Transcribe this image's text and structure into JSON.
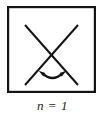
{
  "figure": {
    "caption": "n = 1",
    "caption_variable": "n",
    "caption_relation": "=",
    "caption_value": "1",
    "stroke_color": "#141414",
    "background_color": "#ffffff",
    "box": {
      "x": 7,
      "y": 6,
      "width": 89,
      "height": 87,
      "border_width": 2.2
    },
    "cross": {
      "line_width": 2.0,
      "line_a": {
        "x1": 25,
        "y1": 25,
        "x2": 78,
        "y2": 85
      },
      "line_b": {
        "x1": 78,
        "y1": 25,
        "x2": 25,
        "y2": 85
      }
    },
    "arc_arrow": {
      "description": "double-headed curved arrow",
      "path": "M 41 73 Q 52.5 82.5 64 73",
      "line_width": 2.4,
      "left_head": {
        "x": 41,
        "y": 73
      },
      "right_head": {
        "x": 64,
        "y": 73
      },
      "head_size": 5.2
    }
  }
}
